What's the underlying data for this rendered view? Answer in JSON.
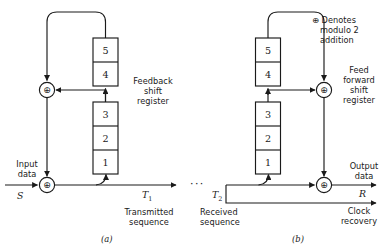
{
  "figure": {
    "type": "scrambler-descrambler-block-diagram",
    "legend": {
      "symbol": "⊕",
      "line1": "⊕ Denotes",
      "line2": "modulo 2",
      "line3": "addition",
      "full_text": "⊕ Denotes modulo 2 addition"
    },
    "ellipsis": "···",
    "stroke_color": "#1a1a1a",
    "background_color": "#ffffff"
  },
  "panel_a": {
    "caption": "(a)",
    "register_label_line1": "Feedback",
    "register_label_line2": "shift",
    "register_label_line3": "register",
    "register_label_full": "Feedback shift register",
    "stages_upper": [
      "5",
      "4"
    ],
    "stages_lower": [
      "3",
      "2",
      "1"
    ],
    "input_label_line1": "Input",
    "input_label_line2": "data",
    "input_symbol": "S",
    "output_symbol": "T",
    "output_subscript": "1",
    "output_label_line1": "Transmitted",
    "output_label_line2": "sequence",
    "adder_top": "⊕",
    "adder_bottom": "⊕"
  },
  "panel_b": {
    "caption": "(b)",
    "register_label_line1": "Feed",
    "register_label_line2": "forward",
    "register_label_line3": "shift",
    "register_label_line4": "register",
    "register_label_full": "Feed forward shift register",
    "stages_upper": [
      "5",
      "4"
    ],
    "stages_lower": [
      "3",
      "2",
      "1"
    ],
    "input_symbol": "T",
    "input_subscript": "2",
    "input_label_line1": "Received",
    "input_label_line2": "sequence",
    "output_label_line1": "Output",
    "output_label_line2": "data",
    "output_symbol": "R",
    "clock_label_line1": "Clock",
    "clock_label_line2": "recovery",
    "adder_top": "⊕",
    "adder_bottom": "⊕"
  }
}
